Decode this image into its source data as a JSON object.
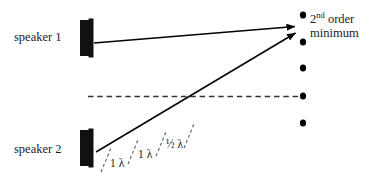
{
  "diagram": {
    "title_text": null,
    "background_color": "#ffffff",
    "ink_color": "#000000",
    "labels": {
      "speaker_1": "speaker 1",
      "speaker_2": "speaker 2",
      "order_minimum_number": "2",
      "order_minimum_ordinal": "nd",
      "order_minimum_word": "order",
      "order_minimum_line2": "minimum"
    },
    "path_difference_labels": [
      {
        "value": "1",
        "symbol": "λ",
        "text": "1 λ"
      },
      {
        "value": "1",
        "symbol": "λ",
        "text": "1 λ"
      },
      {
        "value": "½",
        "symbol": "λ",
        "text": "½ λ"
      }
    ],
    "speakers": [
      {
        "name": "speaker-1",
        "label": "speaker 1",
        "x": 88,
        "y": 38,
        "cone_width": 14,
        "cone_height": 36
      },
      {
        "name": "speaker-2",
        "label": "speaker 2",
        "x": 88,
        "y": 148,
        "cone_width": 14,
        "cone_height": 36
      }
    ],
    "rays": [
      {
        "name": "ray-from-speaker-1",
        "from_x": 94,
        "from_y": 43,
        "to_x": 300,
        "to_y": 26
      },
      {
        "name": "ray-from-speaker-2",
        "from_x": 96,
        "from_y": 152,
        "to_x": 301,
        "to_y": 32
      }
    ],
    "center_line": {
      "name": "central-axis-dashed",
      "x1": 88,
      "y1": 96,
      "x2": 305,
      "y2": 96,
      "style": "dashed"
    },
    "detector_dots": {
      "name": "detector-dot-column",
      "x": 303,
      "y_positions": [
        15,
        42,
        68,
        96,
        123
      ],
      "radius": 3.2,
      "count": 5
    },
    "tick_marks": {
      "name": "wavelength-tick-marks",
      "count": 4,
      "style": "dashed",
      "positions": [
        {
          "x1": 103,
          "y1": 167,
          "x2": 112,
          "y2": 146
        },
        {
          "x1": 130,
          "y1": 159,
          "x2": 139,
          "y2": 138
        },
        {
          "x1": 157,
          "y1": 151,
          "x2": 166,
          "y2": 130
        },
        {
          "x1": 184,
          "y1": 143,
          "x2": 193,
          "y2": 122
        }
      ]
    },
    "colors": {
      "ink": "#000000",
      "text": "#1a1a1a",
      "dash": "#3a3a3a",
      "background": "#ffffff"
    }
  }
}
